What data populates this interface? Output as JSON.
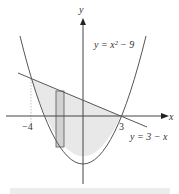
{
  "figure": {
    "axes": {
      "x_label": "x",
      "y_label": "y"
    },
    "ticks": {
      "left": "−4",
      "right": "3"
    },
    "curves": {
      "parabola_label": "y = x² − 9",
      "line_label": "y = 3 − x"
    },
    "colors": {
      "stroke": "#444444",
      "fill": "#e6e6e6",
      "rect_fill": "#cfcfcf",
      "bottom_bar": "#e8e8e8"
    }
  }
}
